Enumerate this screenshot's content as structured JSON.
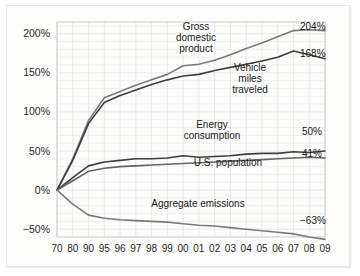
{
  "chart_data": {
    "type": "line",
    "title": "",
    "xlabel": "",
    "ylabel": "",
    "grid": true,
    "legend_position": "inline-annotations",
    "x": [
      "70",
      "80",
      "90",
      "95",
      "96",
      "97",
      "98",
      "99",
      "00",
      "01",
      "02",
      "03",
      "04",
      "05",
      "06",
      "07",
      "08",
      "09"
    ],
    "categories": [
      "70",
      "80",
      "90",
      "95",
      "96",
      "97",
      "98",
      "99",
      "00",
      "01",
      "02",
      "03",
      "04",
      "05",
      "06",
      "07",
      "08",
      "09"
    ],
    "ylim": [
      -60,
      215
    ],
    "ytick_values": [
      200,
      150,
      100,
      50,
      0,
      -50
    ],
    "ytick_labels": [
      "200%",
      "150%",
      "100%",
      "50%",
      "0%",
      "−50%"
    ],
    "series": [
      {
        "name": "Gross domestic product",
        "color": "#7a7a7a",
        "end_value_label": "204%",
        "values": [
          0,
          40,
          89,
          118,
          126,
          134,
          141,
          148,
          159,
          161,
          166,
          173,
          181,
          188,
          196,
          204,
          205,
          204
        ]
      },
      {
        "name": "Vehicle miles traveled",
        "color": "#3d3d3d",
        "end_value_label": "168%",
        "values": [
          0,
          38,
          85,
          112,
          121,
          128,
          135,
          141,
          146,
          148,
          153,
          157,
          161,
          165,
          170,
          178,
          173,
          168
        ]
      },
      {
        "name": "Energy consumption",
        "color": "#3d3d3d",
        "end_value_label": "50%",
        "values": [
          0,
          16,
          31,
          36,
          38,
          40,
          40,
          41,
          44,
          42,
          43,
          44,
          46,
          47,
          47,
          49,
          48,
          50
        ]
      },
      {
        "name": "U.S. population",
        "color": "#636363",
        "end_value_label": "41%",
        "values": [
          0,
          12,
          24,
          28,
          30,
          31,
          32,
          33,
          34,
          35,
          36,
          37,
          38,
          39,
          40,
          41,
          42,
          41
        ]
      },
      {
        "name": "Aggregate emissions",
        "color": "#7a7a7a",
        "end_value_label": "−63%",
        "values": [
          0,
          -18,
          -32,
          -36,
          -38,
          -39,
          -40,
          -41,
          -43,
          -45,
          -46,
          -48,
          -50,
          -52,
          -54,
          -56,
          -60,
          -63
        ]
      }
    ],
    "annotations": [
      {
        "id": "gdp",
        "lines": [
          "Gross",
          "domestic",
          "product"
        ],
        "x": 196,
        "y": 30
      },
      {
        "id": "vmt",
        "lines": [
          "Vehicle",
          "miles",
          "traveled"
        ],
        "x": 250,
        "y": 71
      },
      {
        "id": "energy",
        "lines": [
          "Energy",
          "consumption"
        ],
        "x": 212,
        "y": 128
      },
      {
        "id": "population",
        "lines": [
          "U.S. population"
        ],
        "x": 228,
        "y": 166
      },
      {
        "id": "emissions",
        "lines": [
          "Aggregate emissions"
        ],
        "x": 198,
        "y": 207
      }
    ],
    "end_labels": [
      {
        "id": "gdp",
        "text": "204%",
        "x": 300,
        "y": 30
      },
      {
        "id": "vmt",
        "text": "168%",
        "x": 300,
        "y": 57
      },
      {
        "id": "energy",
        "text": "50%",
        "x": 302,
        "y": 135
      },
      {
        "id": "population",
        "text": "41%",
        "x": 302,
        "y": 157
      },
      {
        "id": "emissions",
        "text": "−63%",
        "x": 300,
        "y": 224
      }
    ]
  },
  "colors": {
    "background": "#fdfdfc",
    "grid": "#e9e9ea",
    "frame": "#c9c9c9",
    "text": "#1a1a1a"
  }
}
